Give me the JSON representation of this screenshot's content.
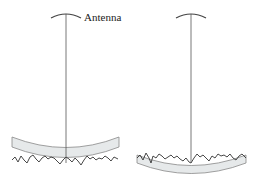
{
  "diagram": {
    "label": "Antenna",
    "colors": {
      "stroke": "#555555",
      "surface_line": "#333333",
      "band_fill": "#e6e9ea",
      "band_stroke": "#888888",
      "background": "#ffffff"
    },
    "panels": [
      {
        "id": "left",
        "antenna_x": 66,
        "antenna_top": 14,
        "line_bottom": 163,
        "has_label": true
      },
      {
        "id": "right",
        "antenna_x": 191,
        "antenna_top": 14,
        "line_bottom": 162,
        "has_label": false
      }
    ]
  }
}
